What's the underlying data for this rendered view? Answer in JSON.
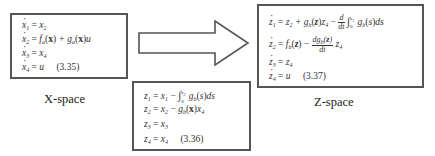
{
  "diagram": {
    "x_space": {
      "label": "X-space",
      "equations": [
        {
          "lhs": "x",
          "lhs_sub": "1",
          "rhs": "= x₂"
        },
        {
          "lhs": "x",
          "lhs_sub": "2",
          "rhs": "= f_a(x) + g_a(x)u"
        },
        {
          "lhs": "x",
          "lhs_sub": "3",
          "rhs": "= x₄"
        },
        {
          "lhs": "x",
          "lhs_sub": "4",
          "rhs": "= u"
        }
      ],
      "equation_number": "(3.35)"
    },
    "transform": {
      "equations": [
        "z₁ = x₁ − ∫₀^x₃ g_b(s)ds",
        "z₂ = x₂ − g_b(x)x₄",
        "z₃ = x₃",
        "z₄ = x₄"
      ],
      "equation_number": "(3.36)"
    },
    "z_space": {
      "label": "Z-space",
      "equations": [
        "ż₁ = z₂ + g_b(z)z₄ − d/dt ∫₀^x₃ g_b(s)ds",
        "ż₂ = f_b(z) − dg_b(z)/dt z₄",
        "ż₃ = z₄",
        "ż₄ = u"
      ],
      "equation_number": "(3.37)"
    },
    "arrow": {
      "direction": "right",
      "from": "X-space",
      "to": "Z-space"
    }
  }
}
